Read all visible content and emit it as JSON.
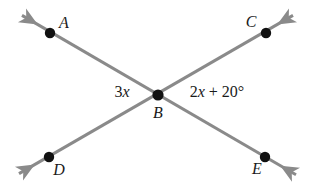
{
  "figure": {
    "width": 316,
    "height": 190,
    "background_color": "#ffffff",
    "line_color": "#8a8a8a",
    "point_color": "#111111",
    "text_color": "#1a1a1a",
    "line_width": 3
  },
  "points": {
    "A": {
      "label": "A",
      "dot_x": 50,
      "dot_y": 33,
      "label_x": 64,
      "label_y": 23
    },
    "B": {
      "label": "B",
      "dot_x": 158,
      "dot_y": 95,
      "label_x": 158,
      "label_y": 113
    },
    "C": {
      "label": "C",
      "dot_x": 266,
      "dot_y": 33,
      "label_x": 251,
      "label_y": 22
    },
    "D": {
      "label": "D",
      "dot_x": 49,
      "dot_y": 157,
      "label_x": 59,
      "label_y": 170
    },
    "E": {
      "label": "E",
      "dot_x": 265,
      "dot_y": 157,
      "label_x": 257,
      "label_y": 169
    }
  },
  "lines": [
    {
      "name": "line-A-B-E",
      "through": [
        "A",
        "B",
        "E"
      ],
      "start_arrow_tip": {
        "x": 18,
        "y": 13
      },
      "end_arrow_tip": {
        "x": 300,
        "y": 177
      },
      "double_headed": true
    },
    {
      "name": "line-D-B-C",
      "through": [
        "D",
        "B",
        "C"
      ],
      "start_arrow_tip": {
        "x": 15,
        "y": 176
      },
      "end_arrow_tip": {
        "x": 297,
        "y": 13
      },
      "double_headed": true
    }
  ],
  "angle_labels": {
    "left": {
      "name": "angle-ABD",
      "text": "3x",
      "coefficient": "3",
      "variable": "x",
      "has_degree_symbol": false,
      "x": 122,
      "y": 92
    },
    "right": {
      "name": "angle-CBE",
      "text": "2x + 20°",
      "coefficient": "2",
      "variable": "x",
      "constant": "20°",
      "has_degree_symbol": true,
      "x": 217,
      "y": 92
    }
  },
  "chart_data": {
    "type": "diagram",
    "vertices": [
      "A",
      "B",
      "C",
      "D",
      "E"
    ],
    "edges": [
      {
        "from": "A",
        "to": "E",
        "via": "B"
      },
      {
        "from": "D",
        "to": "C",
        "via": "B"
      }
    ],
    "angle_expressions": [
      {
        "position": "left of B",
        "expression": "3x",
        "angle": "ABD"
      },
      {
        "position": "right of B",
        "expression": "2x + 20°",
        "angle": "CBE"
      }
    ]
  }
}
